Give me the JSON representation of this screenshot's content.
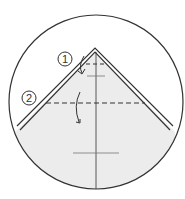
{
  "diagram": {
    "type": "origami-fold-step",
    "steps": [
      {
        "number": "1",
        "description": "fold tip down along upper dashed line"
      },
      {
        "number": "2",
        "description": "fold down along lower dashed line"
      }
    ],
    "colors": {
      "outline": "#333333",
      "paper": "#ececec",
      "background": "#ffffff"
    }
  }
}
